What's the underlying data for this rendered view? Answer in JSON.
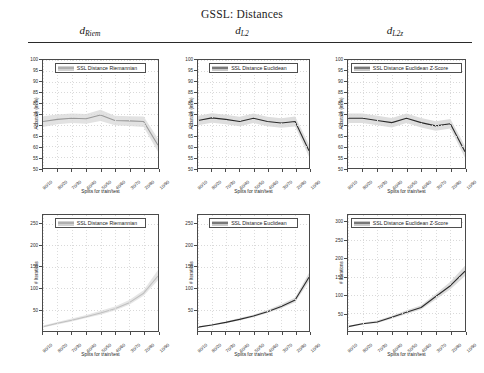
{
  "figure": {
    "title": "GSSL: Distances",
    "column_headers": [
      {
        "name": "d",
        "subscript": "Riem"
      },
      {
        "name": "d",
        "subscript": "L2"
      },
      {
        "name": "d",
        "subscript": "L2z"
      }
    ]
  },
  "chart_data": [
    {
      "type": "line",
      "id": "accuracy-riemannian",
      "title": "",
      "legend": "SSL Distance Riemannian",
      "legend_position": "top-center",
      "grid": true,
      "xlabel": "Splits for train/test",
      "ylabel": "Accuracy (in %)",
      "categories": [
        "90/10",
        "80/20",
        "70/30",
        "60/40",
        "50/50",
        "40/60",
        "30/70",
        "20/80",
        "10/90"
      ],
      "ylim": [
        50,
        100
      ],
      "yticks": [
        50,
        55,
        60,
        65,
        70,
        75,
        80,
        85,
        90,
        95,
        100
      ],
      "series": [
        {
          "name": "SSL Distance Riemannian",
          "color": "#9a9a9a",
          "values": [
            71.5,
            72.5,
            73.0,
            72.8,
            74.5,
            72.0,
            71.8,
            71.5,
            60.5
          ]
        }
      ],
      "band": {
        "lower": [
          69.0,
          70.2,
          70.8,
          70.5,
          71.8,
          69.8,
          69.5,
          69.0,
          57.5
        ],
        "upper": [
          74.0,
          74.8,
          75.2,
          75.0,
          77.0,
          74.2,
          74.0,
          73.8,
          63.5
        ],
        "color": "#e2e2e2"
      }
    },
    {
      "type": "line",
      "id": "accuracy-euclidean",
      "title": "",
      "legend": "SSL Distance Euclidean",
      "legend_position": "top-center",
      "grid": true,
      "xlabel": "Splits for train/test",
      "ylabel": "Accuracy (in %)",
      "categories": [
        "90/10",
        "80/20",
        "70/30",
        "60/40",
        "50/50",
        "40/60",
        "30/70",
        "20/80",
        "10/90"
      ],
      "ylim": [
        50,
        100
      ],
      "yticks": [
        50,
        55,
        60,
        65,
        70,
        75,
        80,
        85,
        90,
        95,
        100
      ],
      "series": [
        {
          "name": "SSL Distance Euclidean",
          "color": "#2b2b2b",
          "values": [
            72.0,
            73.2,
            72.5,
            71.5,
            73.0,
            71.5,
            70.8,
            71.5,
            58.0
          ]
        }
      ],
      "band": {
        "lower": [
          69.8,
          71.0,
          70.3,
          69.3,
          70.8,
          69.3,
          68.6,
          69.2,
          55.2
        ],
        "upper": [
          74.2,
          75.4,
          74.7,
          73.7,
          75.2,
          73.7,
          73.0,
          73.8,
          60.8
        ],
        "color": "#dedede"
      }
    },
    {
      "type": "line",
      "id": "accuracy-euclidean-zscore",
      "title": "",
      "legend": "SSL Distance Euclidean Z-Score",
      "legend_position": "top-center",
      "grid": true,
      "xlabel": "Splits for train/test",
      "ylabel": "Accuracy (in %)",
      "categories": [
        "90/10",
        "80/20",
        "70/30",
        "60/40",
        "50/50",
        "40/60",
        "30/70",
        "20/80",
        "10/90"
      ],
      "ylim": [
        50,
        100
      ],
      "yticks": [
        50,
        55,
        60,
        65,
        70,
        75,
        80,
        85,
        90,
        95,
        100
      ],
      "series": [
        {
          "name": "SSL Distance Euclidean Z-Score",
          "color": "#2b2b2b",
          "values": [
            73.0,
            73.0,
            72.0,
            71.0,
            73.0,
            71.0,
            69.5,
            70.5,
            57.5
          ]
        }
      ],
      "band": {
        "lower": [
          70.8,
          70.8,
          69.8,
          68.8,
          70.8,
          68.8,
          67.3,
          68.3,
          54.8
        ],
        "upper": [
          75.2,
          75.2,
          74.2,
          73.2,
          75.2,
          73.2,
          71.7,
          72.7,
          60.2
        ],
        "color": "#dedede"
      }
    },
    {
      "type": "line",
      "id": "iterations-riemannian",
      "title": "",
      "legend": "SSL Distance Riemannian",
      "legend_position": "top-center",
      "grid": true,
      "xlabel": "Splits for train/test",
      "ylabel": "# Iterations",
      "categories": [
        "90/10",
        "80/20",
        "70/30",
        "60/40",
        "50/50",
        "40/60",
        "30/70",
        "20/80",
        "10/90"
      ],
      "ylim": [
        0,
        270
      ],
      "yticks": [
        50,
        100,
        150,
        200,
        250
      ],
      "series": [
        {
          "name": "SSL Distance Riemannian",
          "color": "#c0c0c0",
          "values": [
            10,
            18,
            25,
            33,
            42,
            52,
            66,
            88,
            128
          ]
        }
      ],
      "band": {
        "lower": [
          8,
          15,
          22,
          30,
          38,
          48,
          61,
          82,
          118
        ],
        "upper": [
          13,
          21,
          29,
          37,
          47,
          57,
          72,
          95,
          142
        ],
        "color": "#e6e6e6"
      }
    },
    {
      "type": "line",
      "id": "iterations-euclidean",
      "title": "",
      "legend": "SSL Distance Euclidean",
      "legend_position": "top-center",
      "grid": true,
      "xlabel": "Splits for train/test",
      "ylabel": "# Iterations",
      "categories": [
        "90/10",
        "80/20",
        "70/30",
        "60/40",
        "50/50",
        "40/60",
        "30/70",
        "20/80",
        "10/90"
      ],
      "ylim": [
        0,
        270
      ],
      "yticks": [
        50,
        100,
        150,
        200,
        250
      ],
      "series": [
        {
          "name": "SSL Distance Euclidean",
          "color": "#2b2b2b",
          "values": [
            9,
            14,
            20,
            27,
            35,
            45,
            57,
            72,
            125
          ]
        }
      ],
      "band": {
        "lower": [
          8,
          13,
          18,
          25,
          32,
          42,
          53,
          67,
          115
        ],
        "upper": [
          11,
          16,
          22,
          30,
          38,
          49,
          62,
          78,
          135
        ],
        "color": "#dcdcdc"
      }
    },
    {
      "type": "line",
      "id": "iterations-euclidean-zscore",
      "title": "",
      "legend": "SSL Distance Euclidean Z-Score",
      "legend_position": "top-center",
      "grid": true,
      "xlabel": "Splits for train/test",
      "ylabel": "# Iterations",
      "categories": [
        "90/10",
        "80/20",
        "70/30",
        "60/40",
        "50/50",
        "40/60",
        "30/70",
        "20/80",
        "10/90"
      ],
      "ylim": [
        0,
        320
      ],
      "yticks": [
        50,
        100,
        150,
        200,
        250,
        300
      ],
      "series": [
        {
          "name": "SSL Distance Euclidean Z-Score",
          "color": "#2b2b2b",
          "values": [
            12,
            20,
            25,
            38,
            52,
            65,
            95,
            125,
            165
          ]
        }
      ],
      "band": {
        "lower": [
          10,
          18,
          22,
          34,
          47,
          59,
          87,
          115,
          152
        ],
        "upper": [
          14,
          23,
          29,
          42,
          57,
          71,
          103,
          136,
          180
        ],
        "color": "#dcdcdc"
      }
    }
  ]
}
